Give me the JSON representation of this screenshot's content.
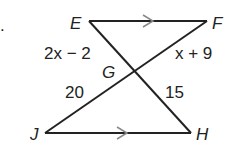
{
  "figure": {
    "bullet": ".",
    "points": {
      "E": "E",
      "F": "F",
      "G": "G",
      "H": "H",
      "J": "J"
    },
    "segments": {
      "EG": "2x − 2",
      "GF": "x + 9",
      "JG": "20",
      "GH": "15"
    },
    "parallel_marks": [
      "EF",
      "JH"
    ],
    "colors": {
      "line": "#222222",
      "arrow": "#888888"
    }
  }
}
